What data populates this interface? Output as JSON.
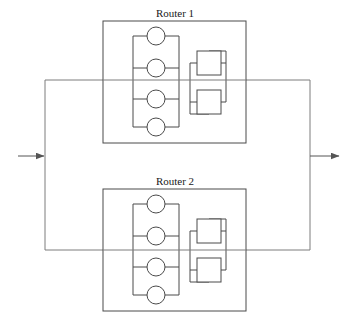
{
  "diagram": {
    "title": "",
    "type": "network-redundancy-diagram",
    "colors": {
      "frame_stroke": "#4a4a4a",
      "link_stroke": "#7d7d7d",
      "arrow_stroke": "#555555",
      "node_fill": "#ffffff",
      "background": "#ffffff",
      "label_text": "#1a1a1a"
    },
    "routers": [
      {
        "id": "router-1",
        "label": "Router 1",
        "label_x": 175,
        "label_y": 17,
        "frame": {
          "x": 103,
          "y": 21,
          "width": 143,
          "height": 122
        },
        "ladder": {
          "x": 133,
          "y": 33,
          "width": 46,
          "height": 94,
          "rails": [
            33,
            64,
            95,
            127
          ],
          "circles": [
            {
              "cx": 156,
              "cy": 36,
              "r": 9
            },
            {
              "cx": 156,
              "cy": 68,
              "r": 9
            },
            {
              "cx": 156,
              "cy": 99,
              "r": 9
            },
            {
              "cx": 156,
              "cy": 127,
              "r": 9
            }
          ]
        },
        "module_stack": {
          "left_rail_x": 190,
          "right_rail_x": 226,
          "rail_top": 51,
          "rail_bottom": 114,
          "boxes": [
            {
              "x": 197,
              "y": 51,
              "width": 24,
              "height": 24
            },
            {
              "x": 197,
              "y": 90,
              "width": 24,
              "height": 24
            }
          ]
        }
      },
      {
        "id": "router-2",
        "label": "Router 2",
        "label_x": 175,
        "label_y": 185,
        "frame": {
          "x": 103,
          "y": 189,
          "width": 143,
          "height": 122
        },
        "ladder": {
          "x": 133,
          "y": 201,
          "width": 46,
          "height": 94,
          "rails": [
            201,
            232,
            263,
            295
          ],
          "circles": [
            {
              "cx": 156,
              "cy": 204,
              "r": 9
            },
            {
              "cx": 156,
              "cy": 236,
              "r": 9
            },
            {
              "cx": 156,
              "cy": 267,
              "r": 9
            },
            {
              "cx": 156,
              "cy": 295,
              "r": 9
            }
          ]
        },
        "module_stack": {
          "left_rail_x": 190,
          "right_rail_x": 226,
          "rail_top": 219,
          "rail_bottom": 282,
          "boxes": [
            {
              "x": 197,
              "y": 219,
              "width": 24,
              "height": 24
            },
            {
              "x": 197,
              "y": 258,
              "width": 24,
              "height": 24
            }
          ]
        }
      }
    ],
    "outer_loop": {
      "left_x": 45,
      "right_x": 310,
      "top_y": 80,
      "bottom_y": 250
    },
    "arrows": [
      {
        "id": "input-arrow",
        "direction": "right",
        "x1": 18,
        "y1": 156,
        "x2": 45,
        "y2": 156,
        "label": ""
      },
      {
        "id": "output-arrow",
        "direction": "right",
        "x1": 310,
        "y1": 156,
        "x2": 340,
        "y2": 156,
        "label": ""
      }
    ]
  }
}
